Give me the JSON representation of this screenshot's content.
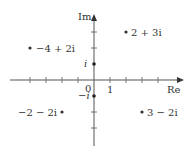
{
  "diagram": {
    "axes": {
      "x_label": "Re",
      "y_label": "Im",
      "origin_label": "0",
      "x_unit_label": "1",
      "i_label": "i",
      "neg_i_label": "−i"
    },
    "points": [
      {
        "label": "2 + 3i",
        "re": 2,
        "im": 3
      },
      {
        "label": "−4 + 2i",
        "re": -4,
        "im": 2
      },
      {
        "label": "−2 − 2i",
        "re": -2,
        "im": -2
      },
      {
        "label": "3 − 2i",
        "re": 3,
        "im": -2
      }
    ],
    "colors": {
      "axis": "#555555",
      "dot": "#333333",
      "text": "#333333"
    }
  }
}
